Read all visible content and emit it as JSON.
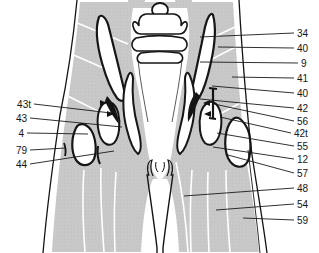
{
  "figure": {
    "type": "anatomical-cross-section-plate",
    "colors": {
      "ink": "#141414",
      "muscle_gray": "#cbcbcb",
      "muscle_stipple": "#aeaeae",
      "bone_white": "#ffffff",
      "leader_line": "#1a1a1a"
    }
  },
  "labels": {
    "left": [
      {
        "text": "43t",
        "tx": 31,
        "ty": 104,
        "lx": 111,
        "ly": 113
      },
      {
        "text": "43",
        "tx": 27,
        "ty": 118,
        "lx": 122,
        "ly": 127
      },
      {
        "text": "4",
        "tx": 24,
        "ty": 133,
        "lx": 88,
        "ly": 134
      },
      {
        "text": "79",
        "tx": 27,
        "ty": 150,
        "lx": 66,
        "ly": 148
      },
      {
        "text": "44",
        "tx": 27,
        "ty": 164,
        "lx": 114,
        "ly": 151
      }
    ],
    "right": [
      {
        "text": "34",
        "tx": 297,
        "ty": 33,
        "lx": 200,
        "ly": 37
      },
      {
        "text": "40",
        "tx": 297,
        "ty": 48,
        "lx": 218,
        "ly": 47
      },
      {
        "text": "9",
        "tx": 301,
        "ty": 63,
        "lx": 200,
        "ly": 62
      },
      {
        "text": "41",
        "tx": 297,
        "ty": 78,
        "lx": 232,
        "ly": 77
      },
      {
        "text": "40",
        "tx": 297,
        "ty": 93,
        "lx": 212,
        "ly": 86
      },
      {
        "text": "42",
        "tx": 297,
        "ty": 108,
        "lx": 200,
        "ly": 99
      },
      {
        "text": "56",
        "tx": 297,
        "ty": 121,
        "lx": 214,
        "ly": 104
      },
      {
        "text": "42t",
        "tx": 294,
        "ty": 133,
        "lx": 220,
        "ly": 117
      },
      {
        "text": "55",
        "tx": 297,
        "ty": 146,
        "lx": 217,
        "ly": 133
      },
      {
        "text": "12",
        "tx": 297,
        "ty": 159,
        "lx": 213,
        "ly": 147
      },
      {
        "text": "57",
        "tx": 297,
        "ty": 173,
        "lx": 228,
        "ly": 155
      },
      {
        "text": "48",
        "tx": 297,
        "ty": 188,
        "lx": 184,
        "ly": 196
      },
      {
        "text": "54",
        "tx": 297,
        "ty": 204,
        "lx": 216,
        "ly": 210
      },
      {
        "text": "59",
        "tx": 297,
        "ty": 220,
        "lx": 243,
        "ly": 218
      }
    ]
  }
}
